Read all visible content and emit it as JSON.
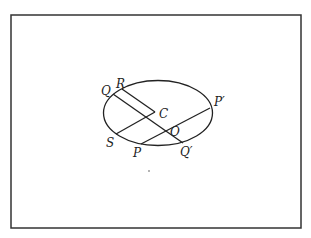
{
  "diagram": {
    "colors": {
      "ink": "#222222",
      "background": "#ffffff"
    },
    "labels": {
      "Q": "Q",
      "R": "R",
      "C": "C",
      "P_prime": "P′",
      "O": "O",
      "S": "S",
      "P": "P",
      "Q_prime": "Q′"
    },
    "segments": [
      {
        "name": "R-C",
        "from": "R",
        "to": "C"
      },
      {
        "name": "Q-Q′",
        "from": "Q",
        "to": "Q′",
        "through": "O"
      },
      {
        "name": "S-C",
        "from": "S",
        "to": "C"
      },
      {
        "name": "P-P′",
        "from": "P",
        "to": "P′",
        "through": "O"
      }
    ]
  }
}
